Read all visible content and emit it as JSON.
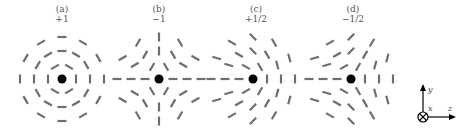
{
  "figure": {
    "panels": [
      {
        "id": "a",
        "label": "(a)",
        "charge": "+1",
        "k": 1,
        "theta0_deg": 90,
        "center": [
          62,
          79
        ]
      },
      {
        "id": "b",
        "label": "(b)",
        "charge": "−1",
        "k": -1,
        "theta0_deg": 0,
        "center": [
          159,
          79
        ]
      },
      {
        "id": "c",
        "label": "(c)",
        "charge": "+1/2",
        "k": 0.5,
        "theta0_deg": 90,
        "center": [
          253,
          79
        ]
      },
      {
        "id": "d",
        "label": "(d)",
        "charge": "−1/2",
        "k": -0.5,
        "theta0_deg": 90,
        "center": [
          351,
          79
        ]
      }
    ],
    "rod_grid": {
      "radii": [
        14,
        28,
        42
      ],
      "angles_per_ring": [
        6,
        12,
        12
      ],
      "rod_length": 9
    },
    "colors": {
      "rod": "#6e6e6e",
      "core": "#000000",
      "axis": "#000000",
      "label": "#555555"
    },
    "axes": {
      "y_label": "y",
      "x_label": "x",
      "z_label": "z",
      "x_symbol": "into-page (⊗)"
    }
  }
}
